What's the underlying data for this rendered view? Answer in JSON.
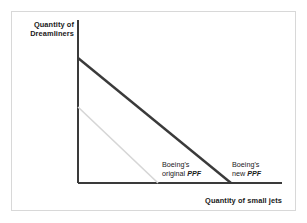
{
  "figure": {
    "type": "economics-ppf-diagram",
    "background_color": "#ffffff",
    "frame_color": "#d8d8d8"
  },
  "axes": {
    "y_axis_title_line1": "Quantity of",
    "y_axis_title_line2": "Dreamliners",
    "x_axis_title": "Quantity of small jets",
    "axis_color": "#3a3a3a"
  },
  "labels": {
    "original_ppf_line1": "Boeing's",
    "original_ppf_line2_text": "original ",
    "original_ppf_line2_em": "PPF",
    "new_ppf_line1": "Boeing's",
    "new_ppf_line2_text": "new ",
    "new_ppf_line2_em": "PPF"
  },
  "chart_data": {
    "type": "line",
    "title": "",
    "xlabel": "Quantity of small jets",
    "ylabel": "Quantity of Dreamliners",
    "xlim": [
      0,
      100
    ],
    "ylim": [
      0,
      100
    ],
    "grid": false,
    "legend": "inline-annotations",
    "series": [
      {
        "name": "Boeing's original PPF",
        "color": "#d6d6d6",
        "linewidth": 1.6,
        "x": [
          0,
          39
        ],
        "y": [
          61,
          0
        ],
        "pixel_start": [
          78,
          107
        ],
        "pixel_end": [
          158,
          183
        ],
        "description": "Lower, shorter straight-line frontier representing the original production possibility frontier"
      },
      {
        "name": "Boeing's new PPF",
        "color": "#3a3a3a",
        "linewidth": 2.4,
        "x": [
          0,
          75
        ],
        "y": [
          100,
          0
        ],
        "pixel_start": [
          78,
          58
        ],
        "pixel_end": [
          231,
          183
        ],
        "description": "Outward-shifted straight-line frontier representing the new production possibility frontier after economic growth"
      }
    ],
    "annotations": [
      {
        "text": "Boeing's original PPF",
        "x_px": 162,
        "y_px": 160
      },
      {
        "text": "Boeing's new PPF",
        "x_px": 232,
        "y_px": 160
      }
    ]
  }
}
